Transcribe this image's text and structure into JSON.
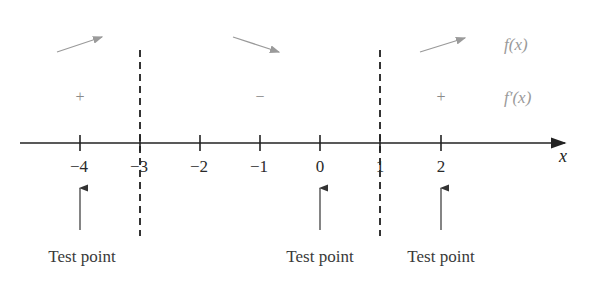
{
  "diagram": {
    "axis": {
      "label": "x",
      "y": 143,
      "x_start": 20,
      "x_end": 565,
      "color": "#222222"
    },
    "ticks": [
      {
        "value": "−4",
        "x": 80
      },
      {
        "value": "−3",
        "x": 140
      },
      {
        "value": "−2",
        "x": 200
      },
      {
        "value": "−1",
        "x": 260
      },
      {
        "value": "0",
        "x": 320
      },
      {
        "value": "1",
        "x": 380
      },
      {
        "value": "2",
        "x": 441
      }
    ],
    "dashed_lines": [
      {
        "at": "−3",
        "x": 140
      },
      {
        "at": "1",
        "x": 380
      }
    ],
    "rows": {
      "f_label": "f(x)",
      "fprime_label": "f′(x)"
    },
    "intervals": [
      {
        "range": "(-∞, -3)",
        "direction": "increasing",
        "sign": "+"
      },
      {
        "range": "(-3, 1)",
        "direction": "decreasing",
        "sign": "−"
      },
      {
        "range": "(1, ∞)",
        "direction": "increasing",
        "sign": "+"
      }
    ],
    "test_points": [
      {
        "label": "Test point",
        "at": "−4"
      },
      {
        "label": "Test point",
        "at": "0"
      },
      {
        "label": "Test point",
        "at": "2"
      }
    ],
    "colors": {
      "light_gray": "#9a9a9a",
      "dark": "#222222"
    }
  }
}
